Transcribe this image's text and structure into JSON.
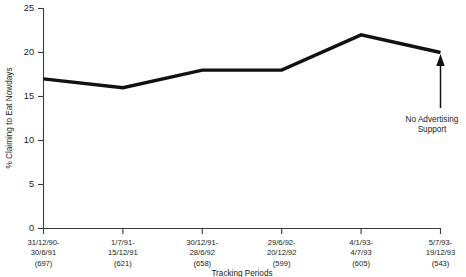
{
  "chart_data": {
    "type": "line",
    "title": "",
    "xlabel": "Tracking Periods",
    "ylabel": "% Claiming to Eat Nowdays",
    "ylim": [
      0,
      25
    ],
    "ytick_values": [
      0,
      5,
      10,
      15,
      20,
      25
    ],
    "ytick_labels": [
      "0",
      "5",
      "10",
      "15",
      "20",
      "25"
    ],
    "grid": false,
    "legend": "none",
    "categories": [
      "31/12/90-30/6/91 (697)",
      "1/7/91-15/12/91 (621)",
      "30/12/91-28/6/92 (658)",
      "29/6/92-20/12/92 (599)",
      "4/1/93-4/7/93 (605)",
      "5/7/93-19/12/93 (543)"
    ],
    "values": [
      17,
      16,
      18,
      18,
      22,
      20
    ],
    "annotations": [
      {
        "text": "No Advertising Support",
        "target_category": "5/7/93-19/12/93 (543)",
        "target_value": 20,
        "arrow": "up"
      }
    ]
  },
  "axes": {
    "y_title": "% Claiming to Eat Nowdays",
    "x_title": "Tracking Periods",
    "y_ticks": [
      {
        "label": "25"
      },
      {
        "label": "20"
      },
      {
        "label": "15"
      },
      {
        "label": "10"
      },
      {
        "label": "5"
      },
      {
        "label": "0"
      }
    ],
    "x_ticks": [
      {
        "line1": "31/12/90-",
        "line2": "30/6/91",
        "line3": "(697)"
      },
      {
        "line1": "1/7/91-",
        "line2": "15/12/91",
        "line3": "(621)"
      },
      {
        "line1": "30/12/91-",
        "line2": "28/6/92",
        "line3": "(658)"
      },
      {
        "line1": "29/6/92-",
        "line2": "20/12/92",
        "line3": "(599)"
      },
      {
        "line1": "4/1/93-",
        "line2": "4/7/93",
        "line3": "(605)"
      },
      {
        "line1": "5/7/93-",
        "line2": "19/12/93",
        "line3": "(543)"
      }
    ]
  },
  "annotation": {
    "line1": "No Advertising",
    "line2": "Support"
  },
  "colors": {
    "series_line": "#111111",
    "axis": "#3b3b3b",
    "text": "#1a1a1a",
    "background": "#ffffff"
  }
}
